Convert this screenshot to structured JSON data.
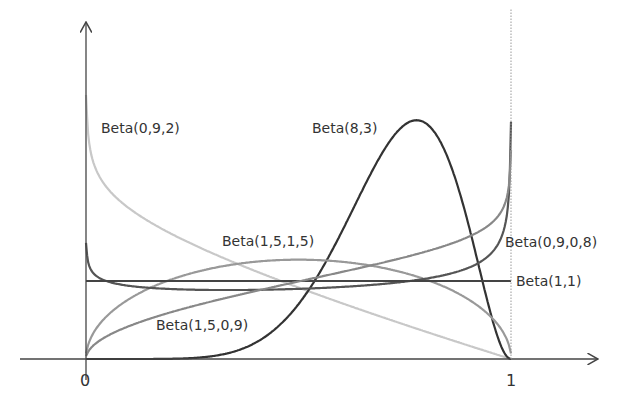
{
  "chart_data": {
    "type": "line",
    "title": "",
    "xlabel": "",
    "ylabel": "",
    "xlim": [
      0,
      1
    ],
    "x_ticks": [
      "0",
      "1"
    ],
    "grid": false,
    "legend_position": "inline labels",
    "series": [
      {
        "name": "Beta(0,9,2)",
        "alpha": 0.9,
        "beta": 2,
        "color": "#c8c8c8",
        "label_pos": [
          101,
          133
        ]
      },
      {
        "name": "Beta(8,3)",
        "alpha": 8,
        "beta": 3,
        "color": "#333333",
        "label_pos": [
          312,
          133
        ]
      },
      {
        "name": "Beta(1,5,1,5)",
        "alpha": 1.5,
        "beta": 1.5,
        "color": "#999999",
        "label_pos": [
          222,
          246
        ]
      },
      {
        "name": "Beta(0,9,0,8)",
        "alpha": 0.9,
        "beta": 0.8,
        "color": "#555555",
        "label_pos": [
          505,
          247
        ]
      },
      {
        "name": "Beta(1,1)",
        "alpha": 1,
        "beta": 1,
        "color": "#444444",
        "label_pos": [
          516,
          286
        ]
      },
      {
        "name": "Beta(1,5,0,9)",
        "alpha": 1.5,
        "beta": 0.9,
        "color": "#888888",
        "label_pos": [
          156,
          330
        ]
      }
    ]
  }
}
